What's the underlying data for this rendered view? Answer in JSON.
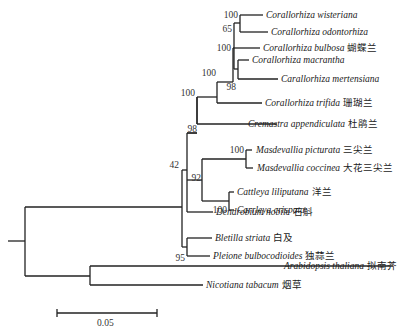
{
  "diagram": {
    "type": "phylogenetic-tree",
    "line_color": "#222222",
    "taxa": [
      {
        "latin": "Corallorhiza wisteriana",
        "chinese": ""
      },
      {
        "latin": "Corallorhiza odontorhiza",
        "chinese": ""
      },
      {
        "latin": "Corallorhiza bulbosa",
        "chinese": "蝴蝶兰"
      },
      {
        "latin": "Corallorhiza macrantha",
        "chinese": ""
      },
      {
        "latin": "Carallorhiza mertensiana",
        "chinese": ""
      },
      {
        "latin": "Corallorhiza trifida",
        "chinese": "珊瑚兰"
      },
      {
        "latin": "Cremastra appendiculata",
        "chinese": "杜鹃兰"
      },
      {
        "latin": "Masdevallia picturata",
        "chinese": "三尖兰"
      },
      {
        "latin": "Masdevallia coccinea",
        "chinese": "大花三尖兰"
      },
      {
        "latin": "Cattleya liliputana",
        "chinese": "洋兰"
      },
      {
        "latin": "Carrleya crispata",
        "chinese": ""
      },
      {
        "latin": "Dendrobium nobile",
        "chinese": "石斛"
      },
      {
        "latin": "Bletilla striata",
        "chinese": "白及"
      },
      {
        "latin": "Pleione bulbocodioides",
        "chinese": "独蒜兰"
      },
      {
        "latin": "Arabidopsis thaliana",
        "chinese": "拟南芥"
      },
      {
        "latin": "Nicotiana tabacum",
        "chinese": "烟草"
      }
    ],
    "bootstrap": {
      "wisteriana_odontorhiza": "100",
      "corallorhiza_a": "65",
      "bulbosa_group": "100",
      "macrantha_mertensiana": "98",
      "corallorhiza_all": "100",
      "with_cremastra": "100",
      "epidendroid": "98",
      "masdevallia": "100",
      "masd_cattleya": "92",
      "cattleya": "100",
      "orchids_all": "42",
      "bletilla_pleione": "95"
    },
    "scale_bar": {
      "label": "0.05"
    }
  }
}
